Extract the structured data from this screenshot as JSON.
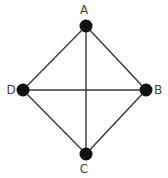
{
  "diagram": {
    "type": "graph",
    "nodes": [
      {
        "id": "A",
        "label": "A",
        "x": 86,
        "y": 26,
        "label_x": 84,
        "label_y": 14
      },
      {
        "id": "B",
        "label": "B",
        "x": 146,
        "y": 90,
        "label_x": 158,
        "label_y": 94
      },
      {
        "id": "C",
        "label": "C",
        "x": 86,
        "y": 154,
        "label_x": 84,
        "label_y": 173
      },
      {
        "id": "D",
        "label": "D",
        "x": 23,
        "y": 90,
        "label_x": 11,
        "label_y": 94
      }
    ],
    "edges": [
      {
        "from": "A",
        "to": "B"
      },
      {
        "from": "B",
        "to": "C"
      },
      {
        "from": "C",
        "to": "D"
      },
      {
        "from": "D",
        "to": "A"
      },
      {
        "from": "A",
        "to": "C"
      },
      {
        "from": "D",
        "to": "B"
      }
    ],
    "colors": {
      "node": "#111111",
      "edge": "#3a3a3a",
      "label": "#444444",
      "background": "#ffffff"
    }
  }
}
